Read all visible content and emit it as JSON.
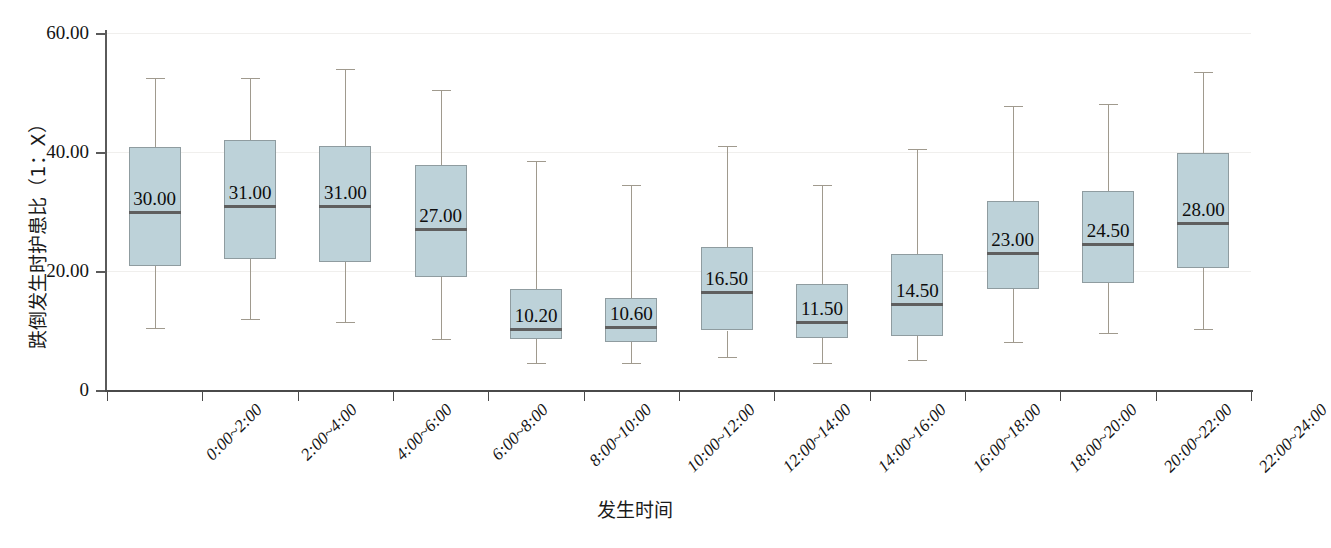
{
  "chart_data": {
    "type": "box",
    "title": "",
    "xlabel": "发生时间",
    "ylabel": "跌倒发生时护患比（1：X）",
    "ylim": [
      0,
      60
    ],
    "y_ticks": [
      "0",
      "20.00",
      "40.00",
      "60.00"
    ],
    "y_tick_values": [
      0,
      20,
      40,
      60
    ],
    "grid": "horizontal-faint",
    "legend": "none",
    "categories": [
      "0:00~2:00",
      "2:00~4:00",
      "4:00~6:00",
      "6:00~8:00",
      "8:00~10:00",
      "10:00~12:00",
      "12:00~14:00",
      "14:00~16:00",
      "16:00~18:00",
      "18:00~20:00",
      "20:00~22:00",
      "22:00~24:00"
    ],
    "median_labels": [
      "30.00",
      "31.00",
      "31.00",
      "27.00",
      "10.20",
      "10.60",
      "16.50",
      "11.50",
      "14.50",
      "23.00",
      "24.50",
      "28.00"
    ],
    "boxes": [
      {
        "category": "0:00~2:00",
        "whisker_low": 10.5,
        "q1": 20.8,
        "median": 30.0,
        "q3": 40.8,
        "whisker_high": 52.5
      },
      {
        "category": "2:00~4:00",
        "whisker_low": 12.0,
        "q1": 22.0,
        "median": 31.0,
        "q3": 42.0,
        "whisker_high": 52.5
      },
      {
        "category": "4:00~6:00",
        "whisker_low": 11.5,
        "q1": 21.5,
        "median": 31.0,
        "q3": 41.0,
        "whisker_high": 54.0
      },
      {
        "category": "6:00~8:00",
        "whisker_low": 8.5,
        "q1": 19.0,
        "median": 27.0,
        "q3": 37.8,
        "whisker_high": 50.5
      },
      {
        "category": "8:00~10:00",
        "whisker_low": 4.5,
        "q1": 8.5,
        "median": 10.2,
        "q3": 17.0,
        "whisker_high": 38.5
      },
      {
        "category": "10:00~12:00",
        "whisker_low": 4.5,
        "q1": 8.0,
        "median": 10.6,
        "q3": 15.5,
        "whisker_high": 34.5
      },
      {
        "category": "12:00~14:00",
        "whisker_low": 5.5,
        "q1": 10.0,
        "median": 16.5,
        "q3": 24.0,
        "whisker_high": 41.0
      },
      {
        "category": "14:00~16:00",
        "whisker_low": 4.5,
        "q1": 8.7,
        "median": 11.5,
        "q3": 17.8,
        "whisker_high": 34.5
      },
      {
        "category": "16:00~18:00",
        "whisker_low": 5.0,
        "q1": 9.0,
        "median": 14.5,
        "q3": 22.8,
        "whisker_high": 40.5
      },
      {
        "category": "18:00~20:00",
        "whisker_low": 8.0,
        "q1": 17.0,
        "median": 23.0,
        "q3": 31.8,
        "whisker_high": 47.8
      },
      {
        "category": "20:00~22:00",
        "whisker_low": 9.5,
        "q1": 18.0,
        "median": 24.5,
        "q3": 33.5,
        "whisker_high": 48.0
      },
      {
        "category": "22:00~24:00",
        "whisker_low": 10.2,
        "q1": 20.5,
        "median": 28.0,
        "q3": 39.8,
        "whisker_high": 53.5
      }
    ],
    "colors": {
      "box_fill": "#bdd2d9",
      "box_border": "#8f9ca0",
      "median": "#5f5f5f",
      "whisker": "#a09a8e",
      "axis": "#4a4a4a",
      "gridline": "#f0efed",
      "text": "#111111",
      "background": "#ffffff"
    }
  }
}
